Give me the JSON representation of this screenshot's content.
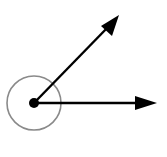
{
  "diagram": {
    "type": "reflex-angle",
    "vertex": {
      "x": 34,
      "y": 103
    },
    "ray_upper_tip": {
      "x": 119,
      "y": 15
    },
    "ray_right_tip": {
      "x": 157,
      "y": 103
    },
    "arc_radius": 27,
    "arc_color": "#8a8a8a",
    "ray_color": "#000000"
  }
}
